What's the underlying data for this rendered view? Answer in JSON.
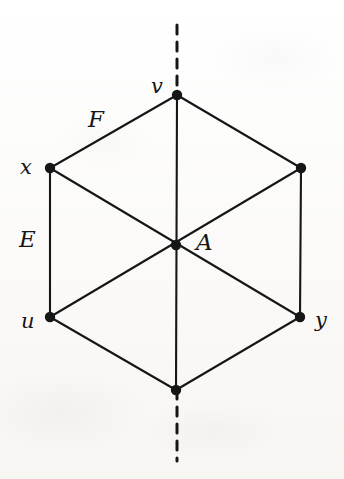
{
  "figure": {
    "kind": "geometry-diagram",
    "width": 344,
    "height": 479,
    "background_color": "#fbfbfa",
    "ink_color": "#161616"
  },
  "geometry": {
    "vertices": [
      {
        "id": "v",
        "label": "v",
        "x": 177,
        "y": 95,
        "label_x": 151,
        "label_y": 76,
        "label_size": "lower",
        "labeled": true
      },
      {
        "id": "x",
        "label": "x",
        "x": 50,
        "y": 168,
        "label_x": 20,
        "label_y": 157,
        "label_size": "lower",
        "labeled": true
      },
      {
        "id": "ne",
        "label": "",
        "x": 301,
        "y": 168,
        "label_x": 0,
        "label_y": 0,
        "label_size": "lower",
        "labeled": false
      },
      {
        "id": "u",
        "label": "u",
        "x": 50,
        "y": 317,
        "label_x": 21,
        "label_y": 311,
        "label_size": "lower",
        "labeled": true
      },
      {
        "id": "y",
        "label": "y",
        "x": 300,
        "y": 317,
        "label_x": 315,
        "label_y": 310,
        "label_size": "lower",
        "labeled": true
      },
      {
        "id": "s",
        "label": "",
        "x": 176,
        "y": 390,
        "label_x": 0,
        "label_y": 0,
        "label_size": "lower",
        "labeled": false
      },
      {
        "id": "A",
        "label": "A",
        "x": 176,
        "y": 245,
        "label_x": 196,
        "label_y": 231,
        "label_size": "upper",
        "labeled": true
      }
    ],
    "edges": [
      {
        "name": "edge-v-x",
        "from": "v",
        "to": "x"
      },
      {
        "name": "edge-v-ne",
        "from": "v",
        "to": "ne"
      },
      {
        "name": "edge-x-u",
        "from": "x",
        "to": "u"
      },
      {
        "name": "edge-ne-y",
        "from": "ne",
        "to": "y"
      },
      {
        "name": "edge-u-s",
        "from": "u",
        "to": "s"
      },
      {
        "name": "edge-y-s",
        "from": "y",
        "to": "s"
      }
    ],
    "diagonals": [
      {
        "name": "diagonal-v-s",
        "from": "v",
        "to": "s"
      },
      {
        "name": "diagonal-x-y",
        "from": "x",
        "to": "y"
      },
      {
        "name": "diagonal-ne-u",
        "from": "ne",
        "to": "u"
      }
    ],
    "edge_labels": [
      {
        "id": "F",
        "label": "F",
        "x": 88,
        "y": 108,
        "label_size": "upper"
      },
      {
        "id": "E",
        "label": "E",
        "x": 19,
        "y": 228,
        "label_size": "upper"
      }
    ],
    "symmetry_axis": {
      "name": "dashed-symmetry-axis",
      "x": 177,
      "segments": [
        {
          "y1": 25,
          "y2": 95
        },
        {
          "y1": 390,
          "y2": 461
        }
      ],
      "dash": "9 8",
      "stroke_width": 3
    },
    "styles": {
      "line_width": 2.1,
      "vertex_radius": 5.2
    }
  }
}
